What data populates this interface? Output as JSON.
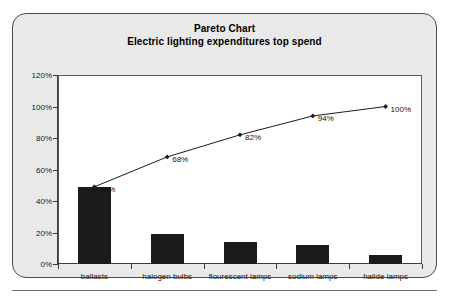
{
  "chart_data": {
    "type": "bar",
    "title": "Pareto Chart",
    "subtitle": "Electric lighting expenditures top spend",
    "xlabel": "",
    "ylabel": "",
    "ylim": [
      0,
      120
    ],
    "ytick_labels": [
      "0%",
      "20%",
      "40%",
      "60%",
      "80%",
      "100%",
      "120%"
    ],
    "ytick_values": [
      0,
      20,
      40,
      60,
      80,
      100,
      120
    ],
    "grid": false,
    "legend": "none",
    "categories": [
      "ballasts",
      "halogen bulbs",
      "flourescent lamps",
      "sodium lamps",
      "halide lamps"
    ],
    "series": [
      {
        "name": "spend share",
        "kind": "bar",
        "values": [
          49,
          19,
          14,
          12,
          6
        ]
      },
      {
        "name": "cumulative",
        "kind": "line",
        "values": [
          49,
          68,
          82,
          94,
          100
        ],
        "point_labels": [
          "49%",
          "68%",
          "82%",
          "94%",
          "100%"
        ]
      }
    ]
  },
  "colors": {
    "panel_background": "#e9e9e9",
    "panel_border": "#4a4a4a",
    "plot_background": "#ffffff",
    "plot_border": "#5a5a5a",
    "bar_fill": "#1b1b1b",
    "line_color": "#1a1a1a",
    "axis_color": "#3c3c3c",
    "text_color": "#111111"
  }
}
